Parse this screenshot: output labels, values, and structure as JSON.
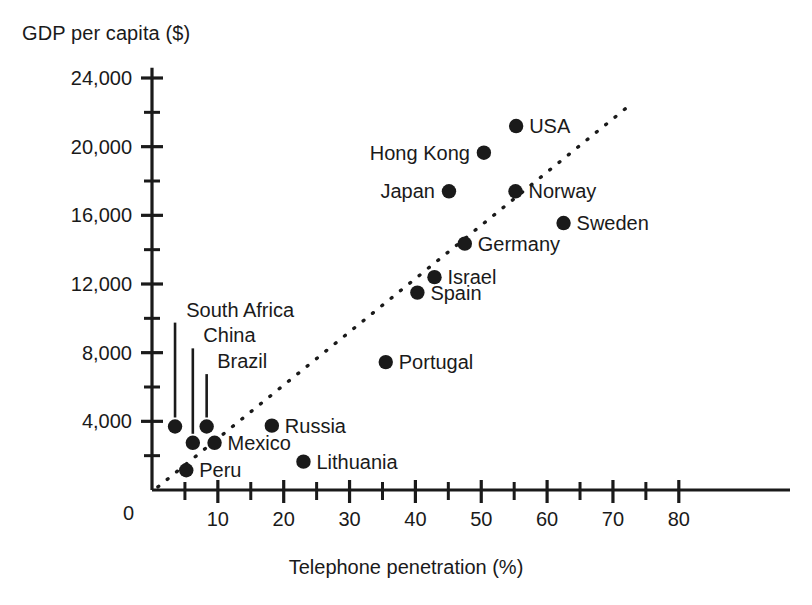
{
  "chart_data": {
    "type": "scatter",
    "title": "",
    "ylabel": "GDP per capita ($)",
    "xlabel": "Telephone penetration (%)",
    "xlim": [
      0,
      85
    ],
    "ylim": [
      0,
      25000
    ],
    "grid": false,
    "legend": null,
    "x_ticks_major": [
      0,
      10,
      20,
      30,
      40,
      50,
      60,
      70,
      80
    ],
    "x_tick_labels": [
      "0",
      "10",
      "20",
      "30",
      "40",
      "50",
      "60",
      "70",
      "80"
    ],
    "x_ticks_minor": [
      5,
      15,
      25,
      35,
      45,
      55,
      65,
      75
    ],
    "y_ticks_major": [
      0,
      4000,
      8000,
      12000,
      16000,
      20000,
      24000
    ],
    "y_tick_labels": [
      "0",
      "4,000",
      "8,000",
      "12,000",
      "16,000",
      "20,000",
      "24,000"
    ],
    "y_ticks_minor": [
      2000,
      6000,
      10000,
      14000,
      18000,
      22000
    ],
    "points": [
      {
        "name": "South Africa",
        "x": 3.5,
        "y": 3700,
        "label_pos": "leader-up",
        "label_x": 5.2,
        "label_y": 10100
      },
      {
        "name": "China",
        "x": 6.2,
        "y": 2750,
        "label_pos": "leader-up",
        "label_x": 7.8,
        "label_y": 8600
      },
      {
        "name": "Brazil",
        "x": 8.3,
        "y": 3700,
        "label_pos": "leader-up",
        "label_x": 9.9,
        "label_y": 7100
      },
      {
        "name": "Mexico",
        "x": 9.5,
        "y": 2750,
        "label_pos": "right"
      },
      {
        "name": "Peru",
        "x": 5.2,
        "y": 1150,
        "label_pos": "right"
      },
      {
        "name": "Russia",
        "x": 18.2,
        "y": 3750,
        "label_pos": "right"
      },
      {
        "name": "Lithuania",
        "x": 23.0,
        "y": 1650,
        "label_pos": "right"
      },
      {
        "name": "Portugal",
        "x": 35.5,
        "y": 7450,
        "label_pos": "right"
      },
      {
        "name": "Spain",
        "x": 40.3,
        "y": 11500,
        "label_pos": "right"
      },
      {
        "name": "Israel",
        "x": 42.9,
        "y": 12400,
        "label_pos": "right"
      },
      {
        "name": "Germany",
        "x": 47.5,
        "y": 14350,
        "label_pos": "right"
      },
      {
        "name": "Japan",
        "x": 45.1,
        "y": 17400,
        "label_pos": "left"
      },
      {
        "name": "Norway",
        "x": 55.2,
        "y": 17400,
        "label_pos": "right"
      },
      {
        "name": "Sweden",
        "x": 62.5,
        "y": 15550,
        "label_pos": "right"
      },
      {
        "name": "Hong Kong",
        "x": 50.4,
        "y": 19650,
        "label_pos": "left"
      },
      {
        "name": "USA",
        "x": 55.3,
        "y": 21200,
        "label_pos": "right"
      }
    ],
    "trendline": {
      "style": "dotted",
      "x0": 0.9,
      "y0": 180,
      "x1": 72.5,
      "y1": 22400
    }
  },
  "colors": {
    "ink": "#1a1a1a",
    "background": "#ffffff"
  }
}
